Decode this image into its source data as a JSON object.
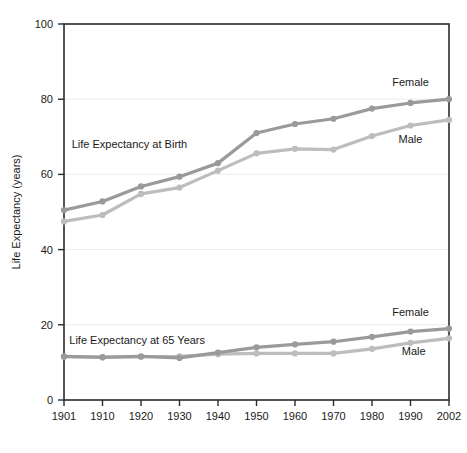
{
  "chart_data": {
    "type": "line",
    "title": "",
    "subtitle": "",
    "xlabel": "",
    "ylabel": "Life Expectancy (years)",
    "x": [
      1901,
      1910,
      1920,
      1930,
      1940,
      1950,
      1960,
      1970,
      1980,
      1990,
      2002
    ],
    "xtick_labels": [
      "1901",
      "1910",
      "1920",
      "1930",
      "1940",
      "1950",
      "1960",
      "1970",
      "1980",
      "1990",
      "2002"
    ],
    "ytick_labels": [
      "0",
      "20",
      "40",
      "60",
      "80",
      "100"
    ],
    "yticks": [
      0,
      20,
      40,
      60,
      80,
      100
    ],
    "ylim": [
      0,
      100
    ],
    "grid": true,
    "legend_position": "inline-right",
    "annotations": [
      {
        "text": "Life Expectancy at Birth",
        "x": 1917,
        "y": 68
      },
      {
        "text": "Life Expectancy at 65 Years",
        "x": 1919,
        "y": 16
      }
    ],
    "series": [
      {
        "name": "Female",
        "group": "Life Expectancy at Birth",
        "color": "#9a9a9a",
        "label": "Female",
        "values": [
          50.5,
          52.8,
          56.8,
          59.4,
          63.0,
          71.0,
          73.4,
          74.8,
          77.5,
          79.0,
          80.0
        ]
      },
      {
        "name": "Male",
        "group": "Life Expectancy at Birth",
        "color": "#bdbdbd",
        "label": "Male",
        "values": [
          47.5,
          49.2,
          54.8,
          56.5,
          61.0,
          65.6,
          66.8,
          66.6,
          70.2,
          73.0,
          74.5
        ]
      },
      {
        "name": "Female",
        "group": "Life Expectancy at 65 Years",
        "color": "#9a9a9a",
        "label": "Female",
        "values": [
          11.6,
          11.4,
          11.6,
          11.2,
          12.6,
          14.0,
          14.8,
          15.5,
          16.8,
          18.2,
          19.0
        ]
      },
      {
        "name": "Male",
        "group": "Life Expectancy at 65 Years",
        "color": "#bdbdbd",
        "label": "Male",
        "values": [
          11.5,
          11.3,
          11.5,
          11.6,
          12.2,
          12.4,
          12.4,
          12.4,
          13.6,
          15.2,
          16.4
        ]
      }
    ],
    "series_labels": [
      {
        "text": "Female",
        "group": "Life Expectancy at Birth",
        "x": 1990,
        "y": 84.5
      },
      {
        "text": "Male",
        "group": "Life Expectancy at Birth",
        "x": 1990,
        "y": 69.5
      },
      {
        "text": "Female",
        "group": "Life Expectancy at 65 Years",
        "x": 1990,
        "y": 23.5
      },
      {
        "text": "Male",
        "group": "Life Expectancy at 65 Years",
        "x": 1991,
        "y": 13.0
      }
    ],
    "colors": {
      "female": "#9a9a9a",
      "male": "#bdbdbd",
      "axis": "#2b2b2b",
      "grid": "#ececec",
      "background": "#ffffff",
      "text": "#1a1a1a"
    }
  }
}
